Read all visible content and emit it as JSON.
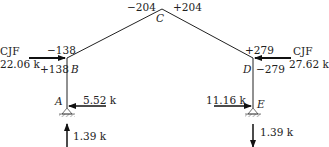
{
  "diagram": {
    "type": "frame-free-body",
    "joints": {
      "A": {
        "label": "A",
        "x": 67,
        "y": 108
      },
      "B": {
        "label": "B",
        "x": 67,
        "y": 58
      },
      "C": {
        "label": "C",
        "x": 162,
        "y": 9
      },
      "D": {
        "label": "D",
        "x": 253,
        "y": 58
      },
      "E": {
        "label": "E",
        "x": 253,
        "y": 108
      }
    },
    "moments": {
      "B_top": "−138",
      "B_side": "+138",
      "C_left": "−204",
      "C_right": "+204",
      "D_top": "+279",
      "D_side": "−279"
    },
    "loads": {
      "left_cjf": {
        "label": "CJF",
        "value": "22.06 k"
      },
      "right_cjf": {
        "label": "CJF",
        "value": "27.62 k"
      },
      "A_horizontal": "5.52 k",
      "E_horizontal": "11.16 k",
      "A_vertical": "1.39 k",
      "E_vertical": "1.39 k"
    },
    "colors": {
      "line": "#222222",
      "text": "#222222",
      "background": "#ffffff"
    }
  }
}
